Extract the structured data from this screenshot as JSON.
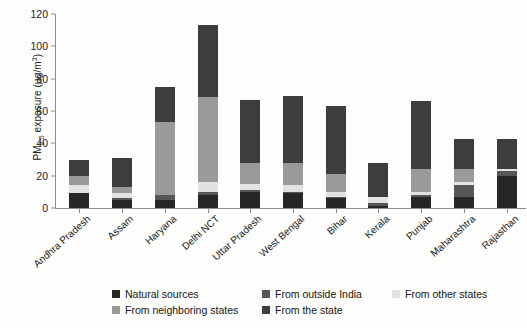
{
  "chart_data": {
    "type": "bar",
    "stacked": true,
    "title": "",
    "xlabel": "",
    "ylabel": "PM2.5 exposure (µg/m³)",
    "ylabel_parts": {
      "prefix": "PM",
      "sub": "2.5",
      "mid": " exposure (µg/m",
      "sup": "3",
      "suffix": ")"
    },
    "ylim": [
      0,
      120
    ],
    "yticks": [
      0,
      20,
      40,
      60,
      80,
      100,
      120
    ],
    "grid": false,
    "legend_position": "bottom",
    "categories": [
      "Andhra Pradesh",
      "Assam",
      "Haryana",
      "Delhi NCT",
      "Uttar Pradesh",
      "West Bengal",
      "Bihar",
      "Kerala",
      "Punjab",
      "Maharashtra",
      "Rajasthan"
    ],
    "series": [
      {
        "name": "Natural sources",
        "color": "#262626",
        "values": [
          9,
          5,
          5,
          8,
          10,
          9,
          6,
          1,
          7,
          7,
          20
        ]
      },
      {
        "name": "From outside India",
        "color": "#565656",
        "values": [
          0,
          1,
          3,
          2,
          1,
          1,
          1,
          2,
          1,
          7,
          3
        ]
      },
      {
        "name": "From other states",
        "color": "#e2e2e2",
        "values": [
          5,
          3,
          0,
          6,
          4,
          4,
          3,
          4,
          2,
          2,
          1
        ]
      },
      {
        "name": "From neighboring states",
        "color": "#9a9a9a",
        "values": [
          6,
          4,
          45,
          53,
          13,
          14,
          11,
          0,
          14,
          8,
          0
        ]
      },
      {
        "name": "From the state",
        "color": "#3d3d3d",
        "values": [
          10,
          18,
          22,
          44,
          39,
          41,
          42,
          21,
          42,
          19,
          19
        ]
      }
    ],
    "totals": [
      30,
      31,
      75,
      113,
      67,
      69,
      63,
      28,
      66,
      43,
      43
    ]
  },
  "legend": {
    "rows": [
      [
        {
          "label": "Natural sources",
          "color": "#262626",
          "width": 150
        },
        {
          "label": "From outside India",
          "color": "#565656",
          "width": 130
        },
        {
          "label": "From other states",
          "color": "#e2e2e2",
          "width": 120
        }
      ],
      [
        {
          "label": "From neighboring states",
          "color": "#9a9a9a",
          "width": 150
        },
        {
          "label": "From the state",
          "color": "#3d3d3d",
          "width": 130
        }
      ]
    ]
  },
  "axis": {
    "y_tick_labels": [
      "0",
      "20",
      "40",
      "60",
      "80",
      "100",
      "120"
    ]
  }
}
